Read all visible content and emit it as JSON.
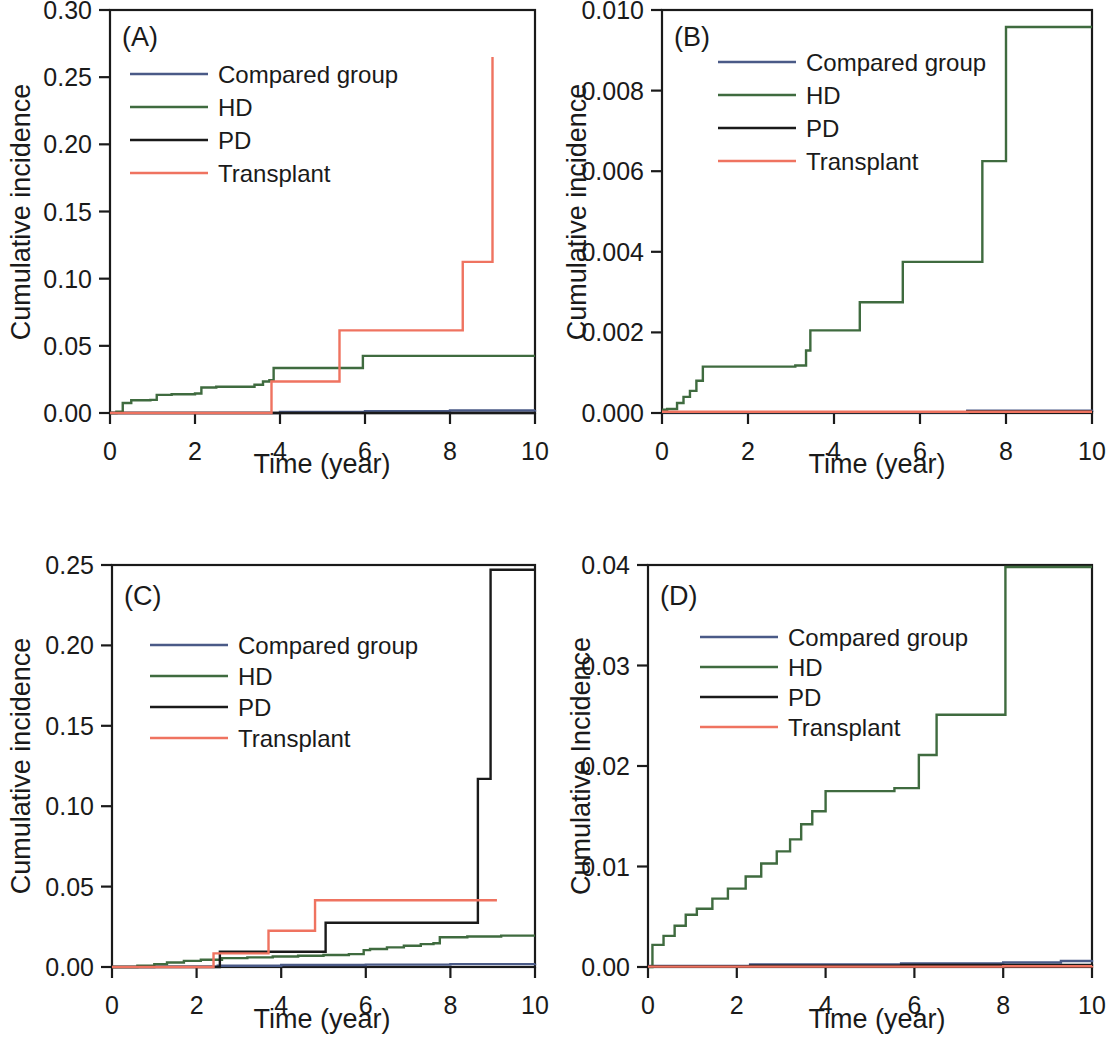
{
  "figure": {
    "kind": "four-panel cumulative incidence step plot",
    "series_colors": {
      "Compared group": "#4a5a87",
      "HD": "#3f6b3f",
      "PD": "#1a1a1a",
      "Transplant": "#ef7360"
    },
    "legend_order": [
      "Compared group",
      "HD",
      "PD",
      "Transplant"
    ]
  },
  "chart_data": [
    {
      "id": "A",
      "type": "line",
      "subtype": "step-post",
      "title": "(A)",
      "xlabel": "Time (year)",
      "ylabel": "Cumulative incidence",
      "xlim": [
        0,
        10
      ],
      "ylim": [
        0.0,
        0.3
      ],
      "xticks": [
        0,
        2,
        4,
        6,
        8,
        10
      ],
      "xticklabels": [
        "0",
        "2",
        "4",
        "6",
        "8",
        "10"
      ],
      "yticks": [
        0.0,
        0.05,
        0.1,
        0.15,
        0.2,
        0.25,
        0.3
      ],
      "yticklabels": [
        "0.00",
        "0.05",
        "0.10",
        "0.15",
        "0.20",
        "0.25",
        "0.30"
      ],
      "grid": false,
      "legend_position": "upper-left-inside",
      "series": [
        {
          "name": "Compared group",
          "x": [
            0,
            2.5,
            4.0,
            6.0,
            8.0,
            10.0
          ],
          "y": [
            0.0,
            0.0,
            0.0008,
            0.0014,
            0.0019,
            0.0022
          ]
        },
        {
          "name": "HD",
          "x": [
            0,
            0.15,
            0.3,
            0.5,
            0.95,
            1.1,
            1.45,
            2.0,
            2.15,
            2.5,
            3.4,
            3.6,
            3.75,
            3.85,
            5.95,
            10.0
          ],
          "y": [
            0.0,
            0.001,
            0.0075,
            0.0095,
            0.0098,
            0.0135,
            0.014,
            0.0145,
            0.019,
            0.0195,
            0.021,
            0.0235,
            0.0245,
            0.0335,
            0.0425,
            0.0425
          ]
        },
        {
          "name": "PD",
          "x": [
            0,
            0.2,
            10.0
          ],
          "y": [
            0.0,
            0.0,
            0.0
          ]
        },
        {
          "name": "Transplant",
          "x": [
            0,
            2.45,
            3.8,
            5.4,
            8.3,
            9.0
          ],
          "y": [
            0.0,
            0.0,
            0.0235,
            0.0615,
            0.1125,
            0.265
          ]
        }
      ]
    },
    {
      "id": "B",
      "type": "line",
      "subtype": "step-post",
      "title": "(B)",
      "xlabel": "Time (year)",
      "ylabel": "Cumulative incidence",
      "xlim": [
        0,
        10
      ],
      "ylim": [
        0.0,
        0.01
      ],
      "xticks": [
        0,
        2,
        4,
        6,
        8,
        10
      ],
      "xticklabels": [
        "0",
        "2",
        "4",
        "6",
        "8",
        "10"
      ],
      "yticks": [
        0.0,
        0.002,
        0.004,
        0.006,
        0.008,
        0.01
      ],
      "yticklabels": [
        "0.000",
        "0.002",
        "0.004",
        "0.006",
        "0.008",
        "0.010"
      ],
      "grid": false,
      "legend_position": "upper-center-inside",
      "series": [
        {
          "name": "Compared group",
          "x": [
            0,
            7.1,
            10.0
          ],
          "y": [
            2e-05,
            6e-05,
            8e-05
          ]
        },
        {
          "name": "HD",
          "x": [
            0,
            0.12,
            0.35,
            0.5,
            0.65,
            0.8,
            0.95,
            3.1,
            3.35,
            3.45,
            4.6,
            5.6,
            7.45,
            8.0,
            10.0
          ],
          "y": [
            8e-05,
            0.0001,
            0.00025,
            0.0004,
            0.00055,
            0.0008,
            0.00115,
            0.00118,
            0.00155,
            0.00205,
            0.00275,
            0.00375,
            0.00625,
            0.00958,
            0.00958
          ]
        },
        {
          "name": "PD",
          "x": [
            0,
            7.1,
            10.0
          ],
          "y": [
            2e-05,
            4e-05,
            5e-05
          ]
        },
        {
          "name": "Transplant",
          "x": [
            0,
            10.0
          ],
          "y": [
            3e-05,
            3e-05
          ]
        }
      ]
    },
    {
      "id": "C",
      "type": "line",
      "subtype": "step-post",
      "title": "(C)",
      "xlabel": "Time (year)",
      "ylabel": "Cumulative incidence",
      "xlim": [
        0,
        10
      ],
      "ylim": [
        0.0,
        0.25
      ],
      "xticks": [
        0,
        2,
        4,
        6,
        8,
        10
      ],
      "xticklabels": [
        "0",
        "2",
        "4",
        "6",
        "8",
        "10"
      ],
      "yticks": [
        0.0,
        0.05,
        0.1,
        0.15,
        0.2,
        0.25
      ],
      "yticklabels": [
        "0.00",
        "0.05",
        "0.10",
        "0.15",
        "0.20",
        "0.25"
      ],
      "grid": false,
      "legend_position": "upper-left-inside",
      "series": [
        {
          "name": "Compared group",
          "x": [
            0,
            1.0,
            2.5,
            4.0,
            6.0,
            8.0,
            10.0
          ],
          "y": [
            0.0,
            0.0002,
            0.0008,
            0.0012,
            0.0015,
            0.0018,
            0.002
          ]
        },
        {
          "name": "HD",
          "x": [
            0,
            0.6,
            1.0,
            1.3,
            1.7,
            2.1,
            2.6,
            3.2,
            3.8,
            4.4,
            5.0,
            5.6,
            5.95,
            6.1,
            6.5,
            6.9,
            7.3,
            7.6,
            7.75,
            8.4,
            9.2,
            10.0
          ],
          "y": [
            0.0,
            0.0008,
            0.0018,
            0.0028,
            0.0038,
            0.0045,
            0.0055,
            0.006,
            0.0065,
            0.007,
            0.0075,
            0.008,
            0.0105,
            0.0112,
            0.0122,
            0.0132,
            0.0142,
            0.0148,
            0.0185,
            0.019,
            0.0195,
            0.0195
          ]
        },
        {
          "name": "PD",
          "x": [
            0,
            2.45,
            2.55,
            5.05,
            8.65,
            8.95,
            10.0
          ],
          "y": [
            0.0,
            0.0,
            0.0095,
            0.0275,
            0.117,
            0.247,
            0.247
          ]
        },
        {
          "name": "Transplant",
          "x": [
            0,
            2.4,
            3.7,
            4.8,
            9.1
          ],
          "y": [
            0.0,
            0.0085,
            0.0225,
            0.0415,
            0.0415
          ]
        }
      ]
    },
    {
      "id": "D",
      "type": "line",
      "subtype": "step-post",
      "title": "(D)",
      "xlabel": "Time (year)",
      "ylabel": "Cumulative Incidence",
      "xlim": [
        0,
        10
      ],
      "ylim": [
        0.0,
        0.04
      ],
      "xticks": [
        0,
        2,
        4,
        6,
        8,
        10
      ],
      "xticklabels": [
        "0",
        "2",
        "4",
        "6",
        "8",
        "10"
      ],
      "yticks": [
        0.0,
        0.01,
        0.02,
        0.03,
        0.04
      ],
      "yticklabels": [
        "0.00",
        "0.01",
        "0.02",
        "0.03",
        "0.04"
      ],
      "grid": false,
      "legend_position": "upper-center-inside",
      "series": [
        {
          "name": "Compared group",
          "x": [
            0,
            2.3,
            5.7,
            8.0,
            9.3,
            10.0
          ],
          "y": [
            0.0001,
            0.00025,
            0.00035,
            0.00045,
            0.0006,
            0.0007
          ]
        },
        {
          "name": "HD",
          "x": [
            0,
            0.1,
            0.35,
            0.6,
            0.85,
            1.1,
            1.45,
            1.8,
            2.2,
            2.55,
            2.9,
            3.2,
            3.45,
            3.7,
            4.0,
            5.55,
            6.1,
            6.5,
            8.05,
            10.0
          ],
          "y": [
            0.0,
            0.0022,
            0.0031,
            0.0041,
            0.0052,
            0.0058,
            0.0068,
            0.0078,
            0.009,
            0.0103,
            0.0115,
            0.0127,
            0.0142,
            0.0155,
            0.0175,
            0.0178,
            0.0211,
            0.0251,
            0.0398,
            0.0398
          ]
        },
        {
          "name": "PD",
          "x": [
            0,
            2.3,
            5.7,
            10.0
          ],
          "y": [
            5e-05,
            0.00012,
            0.0002,
            0.00028
          ]
        },
        {
          "name": "Transplant",
          "x": [
            0,
            8.0,
            10.0
          ],
          "y": [
            4e-05,
            8e-05,
            0.0001
          ]
        }
      ]
    }
  ]
}
